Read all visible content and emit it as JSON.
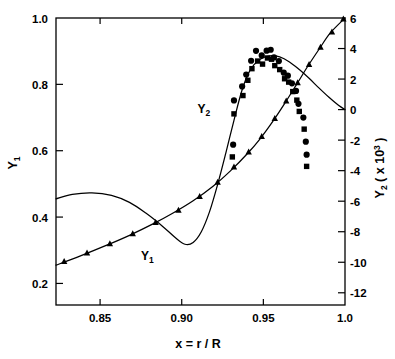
{
  "chart_data": {
    "type": "scatter",
    "title": "",
    "xlabel": "x = r / R",
    "xlabel_parts": {
      "var": "x",
      "eq": " = ",
      "num": "r",
      "slash": " / ",
      "den": "R"
    },
    "ylabel_left": "Y1",
    "ylabel_left_base": "Y",
    "ylabel_left_sub": "1",
    "ylabel_right": "Y2 ( x 10^3 )",
    "ylabel_right_base": "Y",
    "ylabel_right_sub": "2",
    "ylabel_right_rest_open": " ( x 10",
    "ylabel_right_sup": "3",
    "ylabel_right_rest_close": " )",
    "xlim": [
      0.823,
      1.0
    ],
    "ylim_left": [
      0.135,
      1.0
    ],
    "ylim_right": [
      -12.8,
      6.0
    ],
    "xticks": [
      0.85,
      0.9,
      0.95,
      1.0
    ],
    "xticklabels": [
      "0.85",
      "0.90",
      "0.95",
      "1.0"
    ],
    "yticks_left": [
      0.2,
      0.4,
      0.6,
      0.8,
      1.0
    ],
    "yticklabels_left": [
      "0.2",
      "0.4",
      "0.6",
      "0.8",
      "1.0"
    ],
    "yticks_right": [
      -12,
      -10,
      -8,
      -6,
      -4,
      -2,
      0,
      2,
      4,
      6
    ],
    "yticklabels_right": [
      "-12",
      "-10",
      "-8",
      "-6",
      "-4",
      "-2",
      "0",
      "2",
      "4",
      "6"
    ],
    "grid": false,
    "legend_position": "inline-curve-labels",
    "annotations": [
      {
        "text": "Y1",
        "x": 0.879,
        "y_left": 0.272,
        "note": "label for lower rising curve"
      },
      {
        "text": "Y2",
        "x": 0.9135,
        "y_left": 0.714,
        "note": "label for S-shaped curve"
      }
    ],
    "series": [
      {
        "name": "Y1 curve",
        "marker": "none",
        "style": "solid-line",
        "axis": "left",
        "points": [
          [
            0.823,
            0.255
          ],
          [
            0.838,
            0.283
          ],
          [
            0.853,
            0.313
          ],
          [
            0.868,
            0.345
          ],
          [
            0.883,
            0.381
          ],
          [
            0.895,
            0.413
          ],
          [
            0.907,
            0.449
          ],
          [
            0.919,
            0.492
          ],
          [
            0.93,
            0.54
          ],
          [
            0.94,
            0.59
          ],
          [
            0.948,
            0.636
          ],
          [
            0.956,
            0.69
          ],
          [
            0.963,
            0.742
          ],
          [
            0.97,
            0.797
          ],
          [
            0.977,
            0.853
          ],
          [
            0.984,
            0.905
          ],
          [
            0.991,
            0.955
          ],
          [
            1.0,
            1.0
          ]
        ]
      },
      {
        "name": "Y1 data",
        "marker": "triangle",
        "axis": "left",
        "points": [
          [
            0.828,
            0.266
          ],
          [
            0.842,
            0.292
          ],
          [
            0.856,
            0.32
          ],
          [
            0.87,
            0.35
          ],
          [
            0.884,
            0.384
          ],
          [
            0.898,
            0.421
          ],
          [
            0.911,
            0.462
          ],
          [
            0.922,
            0.505
          ],
          [
            0.932,
            0.551
          ],
          [
            0.941,
            0.596
          ],
          [
            0.949,
            0.643
          ],
          [
            0.957,
            0.697
          ],
          [
            0.964,
            0.75
          ],
          [
            0.971,
            0.805
          ],
          [
            0.978,
            0.86
          ],
          [
            0.985,
            0.912
          ],
          [
            0.992,
            0.958
          ],
          [
            0.999,
            0.997
          ]
        ]
      },
      {
        "name": "Y2 curve",
        "marker": "none",
        "style": "solid-line",
        "axis": "right",
        "points": [
          [
            0.823,
            -5.85
          ],
          [
            0.833,
            -5.55
          ],
          [
            0.845,
            -5.45
          ],
          [
            0.857,
            -5.62
          ],
          [
            0.868,
            -6.08
          ],
          [
            0.878,
            -6.78
          ],
          [
            0.888,
            -7.62
          ],
          [
            0.896,
            -8.38
          ],
          [
            0.902,
            -8.82
          ],
          [
            0.907,
            -8.7
          ],
          [
            0.912,
            -8.0
          ],
          [
            0.917,
            -6.7
          ],
          [
            0.922,
            -4.9
          ],
          [
            0.927,
            -2.85
          ],
          [
            0.932,
            -0.7
          ],
          [
            0.937,
            1.3
          ],
          [
            0.942,
            2.6
          ],
          [
            0.948,
            3.3
          ],
          [
            0.954,
            3.52
          ],
          [
            0.96,
            3.45
          ],
          [
            0.966,
            3.12
          ],
          [
            0.972,
            2.62
          ],
          [
            0.978,
            2.05
          ],
          [
            0.984,
            1.42
          ],
          [
            0.99,
            0.82
          ],
          [
            0.996,
            0.28
          ],
          [
            1.0,
            0.0
          ]
        ]
      },
      {
        "name": "Y2 data circles",
        "marker": "circle",
        "axis": "right",
        "points": [
          [
            0.9315,
            -2.3
          ],
          [
            0.932,
            0.6
          ],
          [
            0.937,
            1.52
          ],
          [
            0.9395,
            2.3
          ],
          [
            0.9425,
            3.2
          ],
          [
            0.9455,
            3.85
          ],
          [
            0.949,
            3.55
          ],
          [
            0.952,
            3.86
          ],
          [
            0.9545,
            3.92
          ],
          [
            0.9565,
            3.42
          ],
          [
            0.9595,
            3.18
          ],
          [
            0.9625,
            2.42
          ],
          [
            0.965,
            2.22
          ],
          [
            0.9675,
            1.72
          ],
          [
            0.97,
            1.22
          ],
          [
            0.9715,
            0.38
          ],
          [
            0.9745,
            -0.52
          ],
          [
            0.976,
            -2.1
          ],
          [
            0.9765,
            -2.95
          ]
        ]
      },
      {
        "name": "Y2 data squares",
        "marker": "square",
        "axis": "right",
        "points": [
          [
            0.931,
            -3.1
          ],
          [
            0.932,
            -0.28
          ],
          [
            0.9375,
            0.92
          ],
          [
            0.9405,
            1.92
          ],
          [
            0.943,
            2.68
          ],
          [
            0.9465,
            3.18
          ],
          [
            0.9495,
            2.98
          ],
          [
            0.9525,
            3.38
          ],
          [
            0.955,
            3.3
          ],
          [
            0.957,
            2.88
          ],
          [
            0.96,
            2.62
          ],
          [
            0.963,
            2.02
          ],
          [
            0.9655,
            1.8
          ],
          [
            0.968,
            1.18
          ],
          [
            0.9705,
            0.62
          ],
          [
            0.972,
            -0.12
          ],
          [
            0.975,
            -1.28
          ],
          [
            0.9765,
            -3.72
          ]
        ]
      }
    ]
  },
  "axes": {
    "frame_color": "#000000",
    "line_color": "#000000",
    "marker_color": "#000000"
  }
}
